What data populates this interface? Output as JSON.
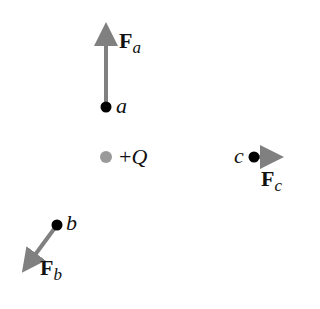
{
  "diagram": {
    "colors": {
      "arrow": "#808080",
      "charge_point": "#9a9a9a",
      "dot": "#000000"
    },
    "source_charge": {
      "sign": "+",
      "symbol": "Q",
      "label": "+Q"
    },
    "points": [
      {
        "id": "a",
        "label": "a",
        "force_label": "F",
        "force_sub": "a",
        "force_direction": "up"
      },
      {
        "id": "b",
        "label": "b",
        "force_label": "F",
        "force_sub": "b",
        "force_direction": "down-left"
      },
      {
        "id": "c",
        "label": "c",
        "force_label": "F",
        "force_sub": "c",
        "force_direction": "right"
      }
    ]
  }
}
